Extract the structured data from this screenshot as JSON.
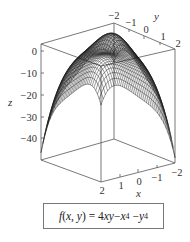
{
  "chart_data": {
    "type": "surface3d",
    "title": "",
    "function": "f(x, y) = 4xy - x^4 - y^4",
    "caption": "f(x, y) = 4xy − x⁴ − y⁴",
    "xlabel": "x",
    "ylabel": "y",
    "zlabel": "z",
    "x_range": [
      -2,
      2
    ],
    "y_range": [
      -2,
      2
    ],
    "z_range": [
      -48,
      2
    ],
    "x_ticks": [
      "2",
      "1",
      "0",
      "−1",
      "−2"
    ],
    "y_ticks": [
      "−2",
      "−1",
      "0",
      "1",
      "2"
    ],
    "z_ticks": [
      "0",
      "−10",
      "−20",
      "−30",
      "−40"
    ],
    "grid": false,
    "legend": "none"
  },
  "labels": {
    "x": "x",
    "y": "y",
    "z": "z",
    "formula_prefix": "f(x, y) = 4xy − x",
    "formula_mid": " − y",
    "exp": "4"
  }
}
